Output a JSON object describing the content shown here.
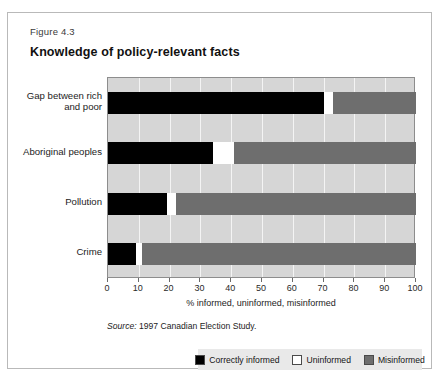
{
  "figure": {
    "number": "Figure 4.3",
    "title": "Knowledge of policy-relevant facts",
    "source": "Source: ",
    "source_text": "1997 Canadian Election Study."
  },
  "colors": {
    "correctly_informed": "#000000",
    "uninformed": "#ffffff",
    "misinformed": "#6e6e6e",
    "plot_background": "#d6d6d6",
    "gridline": "#f4f4f4",
    "legend_background": "#e9e9e9",
    "frame_border": "#b9b9b9"
  },
  "chart_data": {
    "type": "bar",
    "orientation": "horizontal",
    "stacked": true,
    "title": "Knowledge of policy-relevant facts",
    "xlabel": "% informed, uninformed, misinformed",
    "ylabel": "",
    "xlim": [
      0,
      100
    ],
    "xticks": [
      0,
      10,
      20,
      30,
      40,
      50,
      60,
      70,
      80,
      90,
      100
    ],
    "xtick_labels": [
      "0",
      "10",
      "20",
      "30",
      "40",
      "50",
      "60",
      "70",
      "80",
      "90",
      "100"
    ],
    "grid": true,
    "legend_position": "bottom",
    "categories": [
      "Gap between rich and poor",
      "Aboriginal peoples",
      "Pollution",
      "Crime"
    ],
    "category_lines": [
      [
        "Gap between rich",
        "and poor"
      ],
      [
        "Aboriginal peoples"
      ],
      [
        "Pollution"
      ],
      [
        "Crime"
      ]
    ],
    "series": [
      {
        "name": "Correctly informed",
        "color": "#000000",
        "values": [
          70,
          34,
          19,
          9
        ]
      },
      {
        "name": "Uninformed",
        "color": "#ffffff",
        "values": [
          3,
          7,
          3,
          2
        ]
      },
      {
        "name": "Misinformed",
        "color": "#6e6e6e",
        "values": [
          27,
          59,
          78,
          89
        ]
      }
    ],
    "source": "Source: 1997 Canadian Election Study."
  },
  "legend": {
    "items": [
      {
        "label": "Correctly informed",
        "swatch": "black"
      },
      {
        "label": "Uninformed",
        "swatch": "white"
      },
      {
        "label": "Misinformed",
        "swatch": "gray"
      }
    ]
  }
}
